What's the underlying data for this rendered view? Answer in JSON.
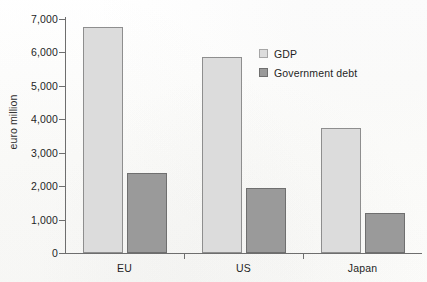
{
  "chart_data": {
    "type": "bar",
    "title": "",
    "subtitle": "",
    "xlabel": "",
    "ylabel": "euro million",
    "categories": [
      "EU",
      "US",
      "Japan"
    ],
    "series": [
      {
        "name": "GDP",
        "values": [
          6750,
          5850,
          3750
        ],
        "color": "#dcdcdc"
      },
      {
        "name": "Government debt",
        "values": [
          2400,
          1950,
          1200
        ],
        "color": "#9a9a9a"
      }
    ],
    "ylim": [
      0,
      7000
    ],
    "ytick_values": [
      0,
      1000,
      2000,
      3000,
      4000,
      5000,
      6000,
      7000
    ],
    "ytick_labels": [
      "0",
      "1,000",
      "2,000",
      "3,000",
      "4,000",
      "5,000",
      "6,000",
      "7,000"
    ],
    "grid": false,
    "legend_position": "upper-right-inside",
    "legend_entries": [
      "GDP",
      "Government debt"
    ],
    "bar_outline_color": "#8c8c8c",
    "axis_color": "#6e6e6e",
    "background_color": "#fdfdfc"
  }
}
